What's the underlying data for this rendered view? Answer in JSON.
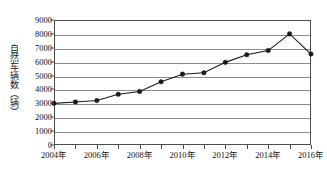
{
  "chart_data": {
    "type": "line",
    "title": "",
    "subtitle": "",
    "xlabel": "",
    "ylabel": "自然车辆数（辆）",
    "x": [
      2004,
      2005,
      2006,
      2007,
      2008,
      2009,
      2010,
      2011,
      2012,
      2013,
      2014,
      2015,
      2016
    ],
    "categories": [
      "2004年",
      "2005年",
      "2006年",
      "2007年",
      "2008年",
      "2009年",
      "2010年",
      "2011年",
      "2012年",
      "2013年",
      "2014年",
      "2015年",
      "2016年"
    ],
    "values": [
      3000,
      3100,
      3200,
      3650,
      3850,
      4550,
      5100,
      5200,
      5950,
      6500,
      6800,
      8000,
      6550
    ],
    "series": [
      {
        "name": "自然车辆数",
        "values": [
          3000,
          3100,
          3200,
          3650,
          3850,
          4550,
          5100,
          5200,
          5950,
          6500,
          6800,
          8000,
          6550
        ]
      }
    ],
    "xlim": [
      2004,
      2016
    ],
    "ylim": [
      0,
      9000
    ],
    "ytick_values": [
      0,
      1000,
      2000,
      3000,
      4000,
      5000,
      6000,
      7000,
      8000,
      9000
    ],
    "ytick_labels": [
      "0",
      "1000",
      "2000",
      "3000",
      "4000",
      "5000",
      "6000",
      "7000",
      "8000",
      "9000"
    ],
    "xtick_values": [
      2004,
      2006,
      2008,
      2010,
      2012,
      2014,
      2016
    ],
    "xtick_labels": [
      "2004年",
      "2006年",
      "2008年",
      "2010年",
      "2012年",
      "2014年",
      "2016年"
    ],
    "grid": "horizontal",
    "legend": "none",
    "marker": "filled-circle",
    "line_color": "#1a1a1a",
    "marker_color": "#1a1a1a",
    "grid_color": "#8c8c8c",
    "axis_color": "#4d4d4d",
    "background_color": "#ffffff"
  }
}
